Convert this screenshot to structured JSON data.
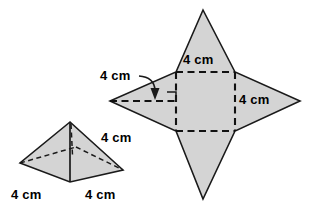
{
  "figure": {
    "colors": {
      "fill": "#d4d4d4",
      "stroke": "#1a1a1a",
      "background": "#ffffff"
    },
    "labels": {
      "net_top": "4 cm",
      "net_right": "4 cm",
      "net_slant": "4 cm",
      "pyramid_slant": "4 cm",
      "pyramid_base_left": "4 cm",
      "pyramid_base_right": "4 cm"
    },
    "annotations": {
      "right_angle_marker": "right-angle-mark",
      "leader_arrow": "arrow-down"
    }
  },
  "geometry": {
    "net": {
      "square": {
        "x1": 176,
        "y1": 72,
        "x2": 235,
        "y2": 131
      },
      "tips": {
        "top": {
          "x": 203,
          "y": 10
        },
        "right": {
          "x": 300,
          "y": 101
        },
        "bottom": {
          "x": 203,
          "y": 199
        },
        "left": {
          "x": 110,
          "y": 101
        }
      }
    },
    "pyramid": {
      "apex": {
        "x": 70,
        "y": 122
      },
      "base": {
        "left": {
          "x": 20,
          "y": 163
        },
        "front": {
          "x": 70,
          "y": 182
        },
        "right": {
          "x": 123,
          "y": 170
        },
        "back": {
          "x": 76,
          "y": 147
        }
      }
    }
  }
}
